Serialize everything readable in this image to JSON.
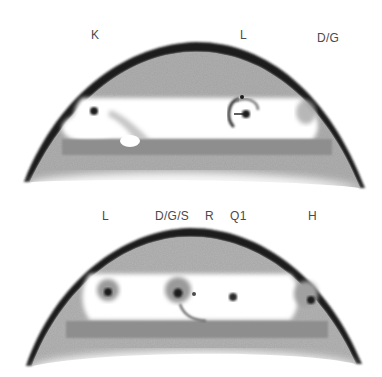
{
  "figure": {
    "panels": [
      {
        "id": "top",
        "labels": [
          {
            "text": "K",
            "x": 91,
            "y": 28
          },
          {
            "text": "L",
            "x": 240,
            "y": 28
          },
          {
            "text": "D/G",
            "x": 317,
            "y": 31
          }
        ]
      },
      {
        "id": "bottom",
        "labels": [
          {
            "text": "L",
            "x": 102,
            "y": 209
          },
          {
            "text": "D/G/S",
            "x": 155,
            "y": 209
          },
          {
            "text": "R",
            "x": 205,
            "y": 209
          },
          {
            "text": "Q1",
            "x": 230,
            "y": 209
          },
          {
            "text": "H",
            "x": 308,
            "y": 209
          }
        ]
      }
    ],
    "colors": {
      "rim": "#1c1c1c",
      "body": "#a8a8a8",
      "light_body": "#c4c4c4",
      "cavity": "#ffffff",
      "bar": "#8c8c8c",
      "spot": "#1a1a1a",
      "label": "#4a4a4a"
    }
  }
}
